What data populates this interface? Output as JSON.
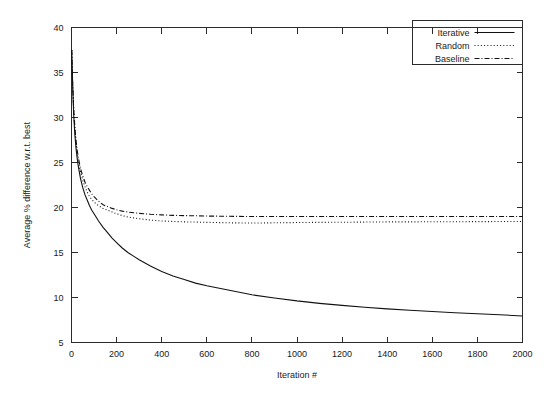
{
  "chart_data": {
    "type": "line",
    "title": "",
    "xlabel": "Iteration #",
    "ylabel": "Average % difference w.r.t. best",
    "xlim": [
      0,
      2000
    ],
    "ylim": [
      5,
      40
    ],
    "grid": false,
    "legend_position": "top-right",
    "xticks": [
      0,
      200,
      400,
      600,
      800,
      1000,
      1200,
      1400,
      1600,
      1800,
      2000
    ],
    "xtick_labels": [
      "0",
      "200",
      "400",
      "600",
      "800",
      "1000",
      "1200",
      "1400",
      "1600",
      "1800",
      "2000"
    ],
    "yticks": [
      5,
      10,
      15,
      20,
      25,
      30,
      35,
      40
    ],
    "ytick_labels": [
      "5",
      "10",
      "15",
      "20",
      "25",
      "30",
      "35",
      "40"
    ],
    "series": [
      {
        "name": "Iterative",
        "style": "solid",
        "x": [
          1,
          5,
          10,
          15,
          20,
          25,
          30,
          40,
          50,
          60,
          70,
          80,
          90,
          100,
          120,
          140,
          160,
          180,
          200,
          225,
          250,
          275,
          300,
          350,
          400,
          450,
          500,
          550,
          600,
          700,
          800,
          900,
          1000,
          1100,
          1200,
          1300,
          1400,
          1500,
          1600,
          1700,
          1800,
          1900,
          2000
        ],
        "values": [
          37.5,
          33.6,
          30.2,
          28.1,
          26.6,
          25.5,
          24.6,
          23.2,
          22.2,
          21.4,
          20.8,
          20.2,
          19.7,
          19.3,
          18.5,
          17.8,
          17.2,
          16.6,
          16.1,
          15.5,
          15.0,
          14.6,
          14.2,
          13.5,
          12.9,
          12.4,
          12.0,
          11.6,
          11.3,
          10.8,
          10.3,
          9.95,
          9.62,
          9.35,
          9.12,
          8.92,
          8.74,
          8.58,
          8.44,
          8.31,
          8.19,
          8.08,
          7.95
        ]
      },
      {
        "name": "Random",
        "style": "dotted",
        "x": [
          1,
          5,
          10,
          15,
          20,
          25,
          30,
          40,
          50,
          60,
          70,
          80,
          90,
          100,
          120,
          140,
          160,
          180,
          200,
          225,
          250,
          275,
          300,
          350,
          400,
          450,
          500,
          550,
          600,
          700,
          800,
          900,
          1000,
          1100,
          1200,
          1300,
          1400,
          1500,
          1600,
          1700,
          1800,
          1900,
          2000
        ],
        "values": [
          37.5,
          33.8,
          30.6,
          28.6,
          27.2,
          26.1,
          25.2,
          23.9,
          23.0,
          22.3,
          21.7,
          21.2,
          20.9,
          20.6,
          20.2,
          19.9,
          19.7,
          19.5,
          19.3,
          19.1,
          18.95,
          18.85,
          18.75,
          18.6,
          18.5,
          18.45,
          18.4,
          18.38,
          18.35,
          18.3,
          18.27,
          18.3,
          18.33,
          18.35,
          18.36,
          18.38,
          18.4,
          18.4,
          18.42,
          18.42,
          18.43,
          18.44,
          18.45
        ]
      },
      {
        "name": "Baseline",
        "style": "dash-dot",
        "x": [
          1,
          5,
          10,
          15,
          20,
          25,
          30,
          40,
          50,
          60,
          70,
          80,
          90,
          100,
          120,
          140,
          160,
          180,
          200,
          225,
          250,
          275,
          300,
          350,
          400,
          450,
          500,
          550,
          600,
          700,
          800,
          900,
          1000,
          1100,
          1200,
          1300,
          1400,
          1500,
          1600,
          1700,
          1800,
          1900,
          2000
        ],
        "values": [
          37.5,
          33.9,
          30.8,
          28.9,
          27.5,
          26.4,
          25.6,
          24.3,
          23.5,
          22.8,
          22.3,
          21.9,
          21.5,
          21.2,
          20.7,
          20.3,
          20.1,
          19.9,
          19.75,
          19.6,
          19.5,
          19.42,
          19.35,
          19.25,
          19.18,
          19.13,
          19.1,
          19.08,
          19.05,
          19.02,
          19.0,
          19.0,
          19.0,
          19.0,
          19.0,
          19.0,
          19.0,
          19.0,
          19.0,
          19.0,
          19.0,
          19.0,
          19.0
        ]
      }
    ]
  },
  "legend": {
    "entries": [
      {
        "label": "Iterative",
        "style": "solid"
      },
      {
        "label": "Random",
        "style": "dotted"
      },
      {
        "label": "Baseline",
        "style": "dash-dot"
      }
    ]
  },
  "colors": {
    "line": "#111111",
    "axis": "#2b2b2b",
    "text": "#1a1a1a",
    "background": "#ffffff"
  }
}
